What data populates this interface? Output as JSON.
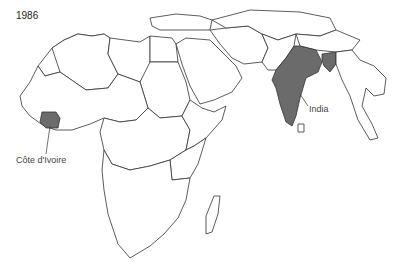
{
  "map": {
    "year": "1986",
    "highlight_color": "#6b6b6b",
    "labels": [
      {
        "name": "India",
        "text": "India"
      },
      {
        "name": "cote-divoire",
        "text": "Côte d'Ivoire"
      }
    ],
    "highlighted_countries": [
      "India",
      "Côte d'Ivoire",
      "Bangladesh"
    ]
  }
}
